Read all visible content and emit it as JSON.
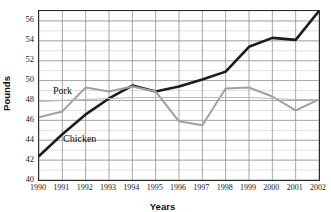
{
  "chart_data": {
    "type": "line",
    "title": "",
    "xlabel": "Years",
    "ylabel": "Pounds",
    "x": [
      1990,
      1991,
      1992,
      1993,
      1994,
      1995,
      1996,
      1997,
      1998,
      1999,
      2000,
      2001,
      2002
    ],
    "xtick_labels": [
      "1990",
      "1991",
      "1992",
      "1993",
      "1994",
      "1995",
      "1996",
      "1997",
      "1998",
      "1999",
      "2000",
      "2001",
      "2002"
    ],
    "ytick_labels": [
      "40",
      "42",
      "44",
      "46",
      "48",
      "50",
      "52",
      "54",
      "56"
    ],
    "ytick_values": [
      40,
      42,
      44,
      46,
      48,
      50,
      52,
      54,
      56
    ],
    "xlim": [
      1990,
      2002
    ],
    "ylim": [
      40,
      57
    ],
    "grid": "both",
    "grid_minor_step": 1,
    "legend_position": "inline-annotation",
    "series": [
      {
        "name": "Chicken",
        "color": "#1c1c1c",
        "width": 2.6,
        "values": [
          42.4,
          44.6,
          46.6,
          48.2,
          49.5,
          48.9,
          49.4,
          50.1,
          50.9,
          53.4,
          54.3,
          54.1,
          57.0
        ]
      },
      {
        "name": "Pork",
        "color": "#a0a0a0",
        "width": 2.0,
        "values": [
          46.3,
          46.9,
          49.3,
          48.9,
          49.4,
          48.9,
          45.9,
          45.5,
          49.2,
          49.3,
          48.4,
          47.0,
          48.1
        ]
      },
      {
        "name": "Pork-reference",
        "color": "#b8b8b8",
        "width": 1.2,
        "values": [
          47.9,
          48.0,
          48.1,
          48.2,
          48.3,
          48.3,
          48.3,
          48.3,
          48.3,
          48.3,
          48.2,
          48.1,
          48.1
        ]
      }
    ],
    "annotations": [
      {
        "text": "Pork",
        "x_px": 53,
        "y_px": 85
      },
      {
        "text": "Chicken",
        "x_px": 63,
        "y_px": 133
      }
    ]
  }
}
